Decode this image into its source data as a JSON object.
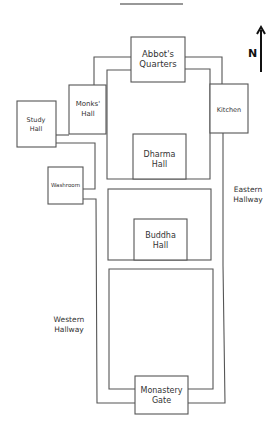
{
  "diagram": {
    "type": "floor-plan",
    "compass": {
      "label": "N",
      "direction": "up"
    },
    "rooms": [
      {
        "id": "abbots-quarters",
        "lines": [
          "Abbot's",
          "Quarters"
        ]
      },
      {
        "id": "monks-hall",
        "lines": [
          "Monks'",
          "Hall"
        ]
      },
      {
        "id": "kitchen",
        "lines": [
          "Kitchen"
        ]
      },
      {
        "id": "study-hall",
        "lines": [
          "Study",
          "Hall"
        ]
      },
      {
        "id": "washroom",
        "lines": [
          "Washroom"
        ]
      },
      {
        "id": "dharma-hall",
        "lines": [
          "Dharma",
          "Hall"
        ]
      },
      {
        "id": "buddha-hall",
        "lines": [
          "Buddha",
          "Hall"
        ]
      },
      {
        "id": "monastery-gate",
        "lines": [
          "Monastery",
          "Gate"
        ]
      }
    ],
    "hallways": [
      {
        "id": "eastern-hallway",
        "lines": [
          "Eastern",
          "Hallway"
        ]
      },
      {
        "id": "western-hallway",
        "lines": [
          "Western",
          "Hallway"
        ]
      }
    ]
  }
}
